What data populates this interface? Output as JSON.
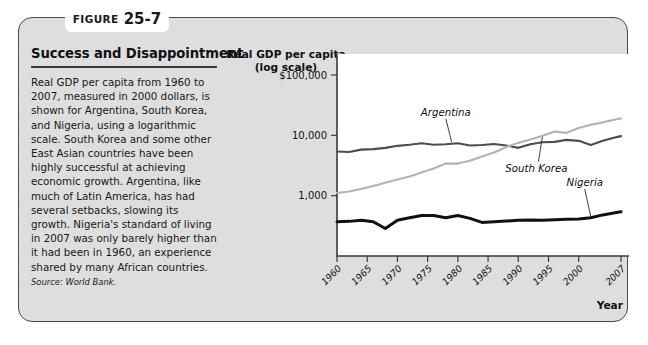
{
  "figure": {
    "label_word": "FIGURE",
    "number": "25-7",
    "heading": "Success and Disappointment",
    "body": "Real GDP per capita from 1960 to 2007, measured in 2000 dollars, is shown for Argentina, South Korea, and Nigeria, using a logarithmic scale. South Korea and some other East Asian countries have been highly successful at achieving economic growth. Argentina, like much of Latin America, has had several setbacks, slowing its growth. Nigeria's standard of living in 2007 was only barely higher than it had been in 1960, an experience shared by many African countries.",
    "source": "Source: World Bank."
  },
  "chart_data": {
    "type": "line",
    "title": "",
    "ylabel": "Real GDP per capita (log scale)",
    "xlabel": "Year",
    "yscale": "log",
    "ylim": [
      100,
      100000
    ],
    "xlim": [
      1960,
      2007
    ],
    "grid": false,
    "legend_position": "inline-labels",
    "ytick_labels": [
      "$100,000",
      "10,000",
      "1,000"
    ],
    "ytick_values": [
      100000,
      10000,
      1000
    ],
    "xtick_labels": [
      "1960",
      "1965",
      "1970",
      "1975",
      "1980",
      "1985",
      "1990",
      "1995",
      "2000",
      "2007"
    ],
    "xtick_values": [
      1960,
      1965,
      1970,
      1975,
      1980,
      1985,
      1990,
      1995,
      2000,
      2007
    ],
    "series": [
      {
        "name": "Argentina",
        "color": "#4d4d4d",
        "width": 2.1,
        "x": [
          1960,
          1962,
          1964,
          1966,
          1968,
          1970,
          1972,
          1974,
          1976,
          1978,
          1980,
          1982,
          1984,
          1986,
          1988,
          1990,
          1992,
          1994,
          1996,
          1998,
          2000,
          2002,
          2004,
          2006,
          2007
        ],
        "values": [
          5400,
          5300,
          5800,
          5900,
          6200,
          6700,
          7000,
          7400,
          7000,
          7100,
          7400,
          6800,
          6900,
          7200,
          6800,
          6200,
          7100,
          7700,
          7800,
          8400,
          8100,
          6900,
          8100,
          9200,
          9700
        ]
      },
      {
        "name": "South Korea",
        "color": "#b3b3b3",
        "width": 2.1,
        "x": [
          1960,
          1962,
          1964,
          1966,
          1968,
          1970,
          1972,
          1974,
          1976,
          1978,
          1980,
          1982,
          1984,
          1986,
          1988,
          1990,
          1992,
          1994,
          1996,
          1998,
          2000,
          2002,
          2004,
          2006,
          2007
        ],
        "values": [
          1110,
          1170,
          1290,
          1450,
          1640,
          1860,
          2080,
          2420,
          2830,
          3400,
          3400,
          3800,
          4450,
          5200,
          6400,
          7500,
          8500,
          9800,
          11600,
          11000,
          13200,
          15000,
          16400,
          18300,
          19000
        ]
      },
      {
        "name": "Nigeria",
        "color": "#111111",
        "width": 3.0,
        "x": [
          1960,
          1962,
          1964,
          1966,
          1968,
          1970,
          1972,
          1974,
          1976,
          1978,
          1980,
          1982,
          1984,
          1986,
          1988,
          1990,
          1992,
          1994,
          1996,
          1998,
          2000,
          2002,
          2004,
          2006,
          2007
        ],
        "values": [
          370,
          375,
          390,
          370,
          285,
          390,
          430,
          470,
          470,
          430,
          470,
          420,
          360,
          370,
          380,
          390,
          395,
          390,
          400,
          405,
          410,
          430,
          480,
          520,
          540
        ]
      }
    ],
    "annotations": [
      {
        "text": "Argentina",
        "x": 1978,
        "y": 22000
      },
      {
        "text": "South Korea",
        "x": 1993,
        "y": 2600
      },
      {
        "text": "Nigeria",
        "x": 2001,
        "y": 1500
      }
    ]
  }
}
